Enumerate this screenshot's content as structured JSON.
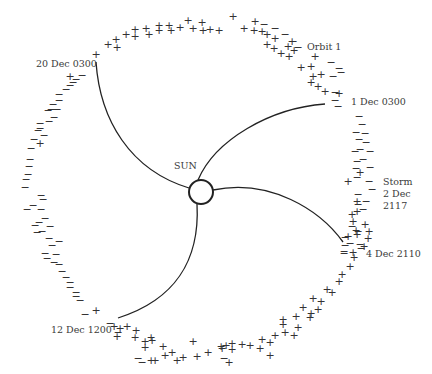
{
  "diagram": {
    "title": "",
    "sun_label": "SUN",
    "orbit_label": "Orbit 1",
    "storm_label": [
      "Storm",
      "2 Dec",
      "2117"
    ],
    "time_labels": {
      "t1": "1 Dec 0300",
      "t2": "4 Dec 2110",
      "t3": "12 Dec 1200",
      "t4": "20 Dec 0300"
    },
    "colors": {
      "line": "#222222",
      "text": "#3a3a3a",
      "background": "#ffffff"
    },
    "legend": {
      "plus": "+",
      "minus": "−"
    },
    "sectors": [
      {
        "from": "1 Dec 0300",
        "to": "4 Dec 2110",
        "polarity": "mostly minus (with plus near storm)"
      },
      {
        "from": "4 Dec 2110",
        "to": "12 Dec 1200",
        "polarity": "plus"
      },
      {
        "from": "12 Dec 1200",
        "to": "20 Dec 0300",
        "polarity": "minus"
      },
      {
        "from": "20 Dec 0300",
        "to": "1 Dec 0300",
        "polarity": "plus (mixed near end)"
      }
    ]
  }
}
